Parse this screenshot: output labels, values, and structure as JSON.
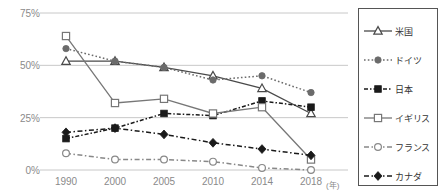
{
  "chart_data": {
    "type": "line",
    "title": "",
    "xlabel": "(年)",
    "ylabel": "",
    "categories": [
      "1990",
      "2000",
      "2005",
      "2010",
      "2014",
      "2018"
    ],
    "ylim": [
      0,
      75
    ],
    "yticks": [
      0,
      25,
      50,
      75
    ],
    "ytick_labels": [
      "0%",
      "25%",
      "50%",
      "75%"
    ],
    "grid": true,
    "legend_position": "right",
    "series": [
      {
        "name": "米国",
        "marker": "open-triangle",
        "line_style": "solid",
        "color": "#4a4a4a",
        "values": [
          52,
          52,
          49,
          45,
          39,
          27
        ]
      },
      {
        "name": "ドイツ",
        "marker": "filled-circle",
        "line_style": "dotted",
        "color": "#6b6b6b",
        "values": [
          58,
          52,
          49,
          43,
          45,
          37
        ]
      },
      {
        "name": "日本",
        "marker": "filled-square",
        "line_style": "dashed-dotted",
        "color": "#1a1a1a",
        "values": [
          15,
          20,
          27,
          26,
          33,
          30
        ]
      },
      {
        "name": "イギリス",
        "marker": "open-square",
        "line_style": "solid",
        "color": "#777777",
        "values": [
          64,
          32,
          34,
          27,
          30,
          5
        ]
      },
      {
        "name": "フランス",
        "marker": "open-circle",
        "line_style": "dash-dot",
        "color": "#888888",
        "values": [
          8,
          5,
          5,
          4,
          1,
          0
        ]
      },
      {
        "name": "カナダ",
        "marker": "filled-diamond",
        "line_style": "dash-dot",
        "color": "#1a1a1a",
        "values": [
          18,
          20,
          17,
          13,
          10,
          7
        ]
      }
    ]
  },
  "axis": {
    "y_tick_labels": [
      "75%",
      "50%",
      "25%",
      "0%"
    ],
    "x_tick_labels": [
      "1990",
      "2000",
      "2005",
      "2010",
      "2014",
      "2018"
    ],
    "x_unit": "(年)"
  },
  "legend": {
    "items": [
      {
        "label": "米国"
      },
      {
        "label": "ドイツ"
      },
      {
        "label": "日本"
      },
      {
        "label": "イギリス"
      },
      {
        "label": "フランス"
      },
      {
        "label": "カナダ"
      }
    ]
  }
}
